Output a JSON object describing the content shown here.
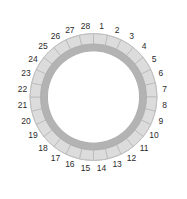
{
  "diagram": {
    "type": "segmented-ring",
    "title": "",
    "background_color": "#ffffff",
    "center_x": 93.5,
    "center_y": 97.0,
    "segment_count": 28,
    "outer_band": {
      "name": "outer-segmented-band",
      "radius_outer": 63.5,
      "radius_inner": 53.0,
      "fill_color": "#dcdcdc",
      "divider_color": "#b4b4b4",
      "edge_color": "#c0c0c0"
    },
    "inner_band": {
      "name": "inner-solid-band",
      "radius_outer": 53.0,
      "radius_inner": 45.5,
      "fill_color": "#b3b3b3",
      "edge_color": "#a6a6a6"
    },
    "center_disc": {
      "name": "center-disc",
      "radius": 45.5,
      "fill_color": "#ffffff"
    },
    "label_radius": 71.5,
    "label_color": "#2b2b2b",
    "label_start_angle_deg": -83.57,
    "label_step_deg": 12.857,
    "segments": [
      {
        "id": 1,
        "label": "1",
        "angle_deg": -83.57
      },
      {
        "id": 2,
        "label": "2",
        "angle_deg": -70.71
      },
      {
        "id": 3,
        "label": "3",
        "angle_deg": -57.86
      },
      {
        "id": 4,
        "label": "4",
        "angle_deg": -45.0
      },
      {
        "id": 5,
        "label": "5",
        "angle_deg": -32.14
      },
      {
        "id": 6,
        "label": "6",
        "angle_deg": -19.29
      },
      {
        "id": 7,
        "label": "7",
        "angle_deg": -6.43
      },
      {
        "id": 8,
        "label": "8",
        "angle_deg": 6.43
      },
      {
        "id": 9,
        "label": "9",
        "angle_deg": 19.29
      },
      {
        "id": 10,
        "label": "10",
        "angle_deg": 32.14
      },
      {
        "id": 11,
        "label": "11",
        "angle_deg": 45.0
      },
      {
        "id": 12,
        "label": "12",
        "angle_deg": 57.86
      },
      {
        "id": 13,
        "label": "13",
        "angle_deg": 70.71
      },
      {
        "id": 14,
        "label": "14",
        "angle_deg": 83.57
      },
      {
        "id": 15,
        "label": "15",
        "angle_deg": 96.43
      },
      {
        "id": 16,
        "label": "16",
        "angle_deg": 109.29
      },
      {
        "id": 17,
        "label": "17",
        "angle_deg": 122.14
      },
      {
        "id": 18,
        "label": "18",
        "angle_deg": 135.0
      },
      {
        "id": 19,
        "label": "19",
        "angle_deg": 147.86
      },
      {
        "id": 20,
        "label": "20",
        "angle_deg": 160.71
      },
      {
        "id": 21,
        "label": "21",
        "angle_deg": 173.57
      },
      {
        "id": 22,
        "label": "22",
        "angle_deg": 186.43
      },
      {
        "id": 23,
        "label": "23",
        "angle_deg": 199.29
      },
      {
        "id": 24,
        "label": "24",
        "angle_deg": 212.14
      },
      {
        "id": 25,
        "label": "25",
        "angle_deg": 225.0
      },
      {
        "id": 26,
        "label": "26",
        "angle_deg": 237.86
      },
      {
        "id": 27,
        "label": "27",
        "angle_deg": 250.71
      },
      {
        "id": 28,
        "label": "28",
        "angle_deg": 263.57
      }
    ]
  }
}
